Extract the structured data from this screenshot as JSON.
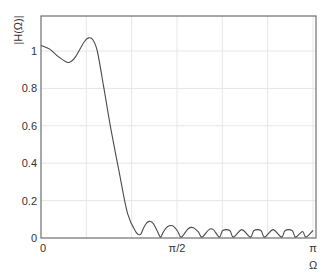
{
  "chart_data": {
    "type": "line",
    "title": "",
    "xlabel": "Ω",
    "ylabel": "|H(Ω)|",
    "xlim": [
      0,
      3.1416
    ],
    "ylim": [
      0,
      1.19
    ],
    "grid": true,
    "legend": null,
    "x_ticks": [
      {
        "value": 0,
        "label": "0"
      },
      {
        "value": 1.5708,
        "label": "π/2"
      },
      {
        "value": 3.1416,
        "label": "π"
      }
    ],
    "x_gridlines": [
      0.5236,
      1.0472,
      1.5708,
      2.0944,
      2.618,
      3.1416
    ],
    "y_ticks": [
      {
        "value": 0,
        "label": "0"
      },
      {
        "value": 0.2,
        "label": "0.2"
      },
      {
        "value": 0.4,
        "label": "0.4"
      },
      {
        "value": 0.6,
        "label": "0.6"
      },
      {
        "value": 0.8,
        "label": "0.8"
      },
      {
        "value": 1.0,
        "label": "1"
      }
    ],
    "series": [
      {
        "name": "|H(Ω)|",
        "color": "#4a4a4a",
        "x": [
          0,
          0.1,
          0.2,
          0.3,
          0.35,
          0.4,
          0.5,
          0.55,
          0.6,
          0.65,
          0.72,
          0.8,
          0.9,
          1.0,
          1.1,
          1.15,
          1.18,
          1.22,
          1.26,
          1.3,
          1.34,
          1.38,
          1.41,
          1.46,
          1.52,
          1.58,
          1.62,
          1.7,
          1.76,
          1.82,
          1.86,
          1.94,
          1.99,
          2.06,
          2.1,
          2.18,
          2.22,
          2.3,
          2.34,
          2.42,
          2.46,
          2.54,
          2.58,
          2.66,
          2.7,
          2.78,
          2.82,
          2.9,
          2.94,
          3.02,
          3.06,
          3.1416
        ],
        "y": [
          1.03,
          1.01,
          0.97,
          0.94,
          0.945,
          0.97,
          1.05,
          1.07,
          1.06,
          1.0,
          0.82,
          0.6,
          0.36,
          0.13,
          0.03,
          0.02,
          0.05,
          0.08,
          0.09,
          0.075,
          0.04,
          0.005,
          0.03,
          0.06,
          0.065,
          0.035,
          0.005,
          0.05,
          0.055,
          0.03,
          0.005,
          0.045,
          0.045,
          0.005,
          0.04,
          0.04,
          0.005,
          0.04,
          0.04,
          0.005,
          0.04,
          0.04,
          0.005,
          0.04,
          0.04,
          0.005,
          0.04,
          0.04,
          0.005,
          0.035,
          0.005,
          0.04
        ]
      }
    ]
  },
  "axes": {
    "ylabel": "|H(Ω)|",
    "xlabel": "Ω"
  }
}
